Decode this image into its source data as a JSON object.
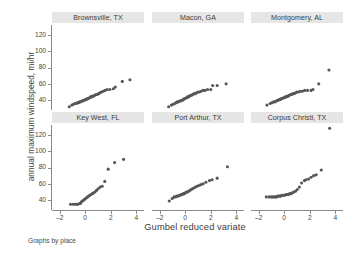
{
  "figure": {
    "xlabel": "Gumbel reduced variate",
    "ylabel": "annual maximum windspeed, mi/hr",
    "footnote": "Graphs by place"
  },
  "chart_data": {
    "type": "scatter",
    "title": "",
    "xlabel": "Gumbel reduced variate",
    "ylabel": "annual maximum windspeed, mi/hr",
    "footnote": "Graphs by place",
    "grid": false,
    "legend": null,
    "layout": {
      "rows": 2,
      "cols": 3,
      "shared_x": true,
      "shared_y": true
    },
    "marker_color": "#55565a",
    "panel_title_bg": "#e6e6e6",
    "xlim": [
      -2.6,
      4.6
    ],
    "ylim": [
      28,
      132
    ],
    "xticks": [
      -2,
      0,
      2,
      4
    ],
    "yticks": [
      40,
      60,
      80,
      100,
      120
    ],
    "panels": [
      {
        "name": "Brownsville, TX",
        "row": 0,
        "col": 0,
        "x": [
          -1.25,
          -1.05,
          -0.92,
          -0.8,
          -0.7,
          -0.61,
          -0.52,
          -0.44,
          -0.36,
          -0.28,
          -0.2,
          -0.13,
          -0.05,
          0.02,
          0.1,
          0.17,
          0.25,
          0.33,
          0.41,
          0.49,
          0.57,
          0.66,
          0.75,
          0.84,
          0.94,
          1.04,
          1.15,
          1.27,
          1.4,
          1.55,
          1.72,
          1.93,
          2.2,
          2.35,
          2.9,
          3.5
        ],
        "y": [
          32,
          34,
          35,
          36,
          36,
          37,
          37,
          38,
          38,
          39,
          39,
          40,
          40,
          41,
          41,
          42,
          42,
          43,
          44,
          44,
          45,
          45,
          46,
          47,
          47,
          48,
          49,
          50,
          51,
          52,
          53,
          53,
          54,
          56,
          63,
          65
        ]
      },
      {
        "name": "Macon, GA",
        "row": 0,
        "col": 1,
        "x": [
          -1.3,
          -1.08,
          -0.94,
          -0.82,
          -0.71,
          -0.62,
          -0.53,
          -0.45,
          -0.37,
          -0.29,
          -0.21,
          -0.14,
          -0.06,
          0.01,
          0.09,
          0.17,
          0.25,
          0.33,
          0.41,
          0.5,
          0.59,
          0.68,
          0.78,
          0.88,
          0.99,
          1.11,
          1.24,
          1.38,
          1.55,
          1.75,
          2.0,
          2.15,
          2.5,
          3.2
        ],
        "y": [
          32,
          34,
          35,
          36,
          37,
          38,
          38,
          39,
          39,
          40,
          40,
          41,
          42,
          42,
          43,
          44,
          44,
          45,
          46,
          46,
          47,
          48,
          48,
          49,
          50,
          50,
          51,
          52,
          52,
          53,
          53,
          58,
          58,
          60
        ]
      },
      {
        "name": "Montgomery, AL",
        "row": 0,
        "col": 2,
        "x": [
          -1.35,
          -1.1,
          -0.95,
          -0.83,
          -0.72,
          -0.63,
          -0.54,
          -0.46,
          -0.38,
          -0.3,
          -0.22,
          -0.15,
          -0.07,
          0.0,
          0.08,
          0.16,
          0.24,
          0.32,
          0.4,
          0.49,
          0.58,
          0.67,
          0.77,
          0.88,
          0.99,
          1.12,
          1.26,
          1.42,
          1.6,
          1.82,
          2.1,
          2.25,
          2.7,
          3.5
        ],
        "y": [
          34,
          36,
          37,
          38,
          38,
          39,
          40,
          40,
          41,
          41,
          42,
          42,
          43,
          43,
          44,
          44,
          45,
          45,
          46,
          47,
          47,
          48,
          48,
          49,
          50,
          50,
          51,
          51,
          52,
          52,
          52,
          53,
          60,
          77
        ]
      },
      {
        "name": "Key West, FL",
        "row": 1,
        "col": 0,
        "x": [
          -1.15,
          -0.95,
          -0.8,
          -0.68,
          -0.57,
          -0.47,
          -0.38,
          -0.3,
          -0.22,
          -0.14,
          -0.06,
          0.02,
          0.1,
          0.18,
          0.27,
          0.36,
          0.45,
          0.55,
          0.65,
          0.76,
          0.88,
          1.01,
          1.16,
          1.33,
          1.53,
          1.8,
          2.3,
          3.0
        ],
        "y": [
          35,
          35,
          35,
          35,
          35,
          36,
          36,
          38,
          39,
          40,
          41,
          42,
          43,
          44,
          45,
          46,
          47,
          48,
          49,
          50,
          52,
          54,
          56,
          57,
          63,
          78,
          86,
          90
        ]
      },
      {
        "name": "Port Arthur, TX",
        "row": 1,
        "col": 1,
        "x": [
          -1.25,
          -1.02,
          -0.88,
          -0.76,
          -0.66,
          -0.56,
          -0.47,
          -0.39,
          -0.31,
          -0.23,
          -0.15,
          -0.07,
          0.01,
          0.09,
          0.18,
          0.27,
          0.36,
          0.46,
          0.56,
          0.67,
          0.79,
          0.92,
          1.06,
          1.22,
          1.4,
          1.62,
          1.9,
          2.1,
          2.5,
          3.3
        ],
        "y": [
          39,
          42,
          44,
          44,
          45,
          45,
          46,
          46,
          47,
          47,
          48,
          48,
          49,
          50,
          50,
          51,
          52,
          53,
          54,
          55,
          56,
          57,
          58,
          59,
          60,
          62,
          64,
          65,
          67,
          81
        ]
      },
      {
        "name": "Corpus Christi, TX",
        "row": 1,
        "col": 2,
        "x": [
          -1.4,
          -1.18,
          -1.02,
          -0.9,
          -0.79,
          -0.69,
          -0.6,
          -0.51,
          -0.43,
          -0.35,
          -0.27,
          -0.19,
          -0.11,
          -0.03,
          0.05,
          0.14,
          0.23,
          0.32,
          0.42,
          0.52,
          0.63,
          0.75,
          0.88,
          1.02,
          1.18,
          1.36,
          1.58,
          1.7,
          1.9,
          2.1,
          2.3,
          2.5,
          2.9,
          3.55
        ],
        "y": [
          44,
          44,
          44,
          44,
          44,
          44,
          44,
          45,
          45,
          45,
          45,
          46,
          46,
          46,
          46,
          47,
          47,
          47,
          48,
          48,
          49,
          50,
          51,
          53,
          56,
          61,
          64,
          65,
          66,
          68,
          70,
          71,
          77,
          128
        ]
      }
    ]
  }
}
